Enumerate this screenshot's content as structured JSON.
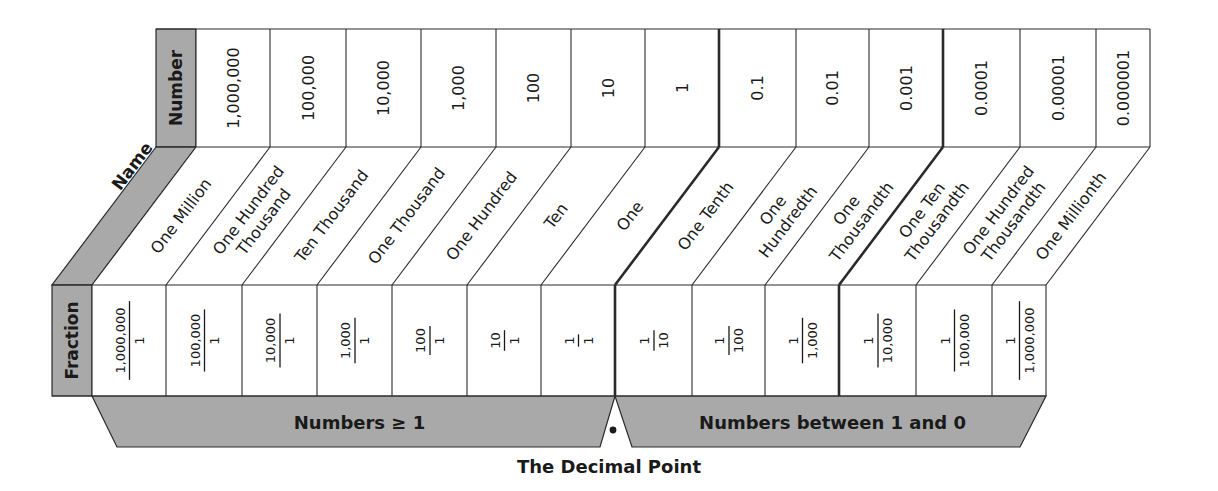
{
  "colors": {
    "header_fill": "#a9a9a9",
    "band_fill": "#a9a9a9",
    "cell_fill": "#ffffff",
    "line": "#2a2a2a"
  },
  "row_headers": {
    "number": "Number",
    "name": "Name",
    "fraction": "Fraction"
  },
  "columns": [
    {
      "number": "1,000,000",
      "name": [
        "One Million"
      ],
      "fraction": {
        "num": "1,000,000",
        "den": "1"
      }
    },
    {
      "number": "100,000",
      "name": [
        "One Hundred",
        "Thousand"
      ],
      "fraction": {
        "num": "100,000",
        "den": "1"
      }
    },
    {
      "number": "10,000",
      "name": [
        "Ten Thousand"
      ],
      "fraction": {
        "num": "10,000",
        "den": "1"
      }
    },
    {
      "number": "1,000",
      "name": [
        "One Thousand"
      ],
      "fraction": {
        "num": "1,000",
        "den": "1"
      }
    },
    {
      "number": "100",
      "name": [
        "One Hundred"
      ],
      "fraction": {
        "num": "100",
        "den": "1"
      }
    },
    {
      "number": "10",
      "name": [
        "Ten"
      ],
      "fraction": {
        "num": "10",
        "den": "1"
      }
    },
    {
      "number": "1",
      "name": [
        "One"
      ],
      "fraction": {
        "num": "1",
        "den": "1"
      }
    },
    {
      "number": "0.1",
      "name": [
        "One Tenth"
      ],
      "fraction": {
        "num": "1",
        "den": "10"
      }
    },
    {
      "number": "0.01",
      "name": [
        "One",
        "Hundredth"
      ],
      "fraction": {
        "num": "1",
        "den": "100"
      }
    },
    {
      "number": "0.001",
      "name": [
        "One",
        "Thousandth"
      ],
      "fraction": {
        "num": "1",
        "den": "1,000"
      }
    },
    {
      "number": "0.0001",
      "name": [
        "One Ten",
        "Thousandth"
      ],
      "fraction": {
        "num": "1",
        "den": "10,000"
      }
    },
    {
      "number": "0.00001",
      "name": [
        "One Hundred",
        "Thousandth"
      ],
      "fraction": {
        "num": "1",
        "den": "100,000"
      }
    },
    {
      "number": "0.000001",
      "name": [
        "One Millionth"
      ],
      "fraction": {
        "num": "1",
        "den": "1,000,000"
      }
    }
  ],
  "bands": {
    "left": "Numbers ≥ 1",
    "right": "Numbers between 1 and 0"
  },
  "decimal_point_symbol": "•",
  "caption": "The Decimal Point"
}
